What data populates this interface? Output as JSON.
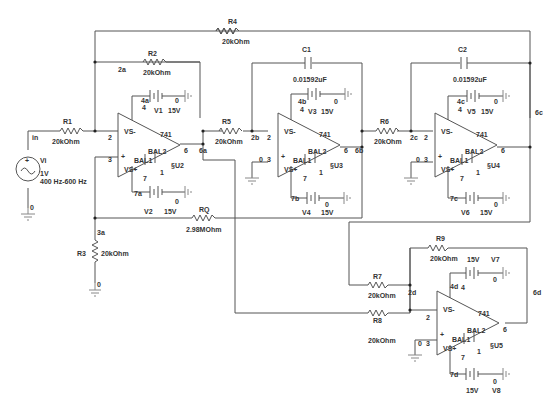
{
  "schematic": {
    "source": {
      "name": "Vi",
      "amplitude": "1V",
      "frequency": "400 Hz-600 Hz",
      "node_in": "in",
      "ground_node": "0"
    },
    "resistors": [
      {
        "id": "R1",
        "value": "20kOhm"
      },
      {
        "id": "R2",
        "value": "20kOhm"
      },
      {
        "id": "R3",
        "value": "20kOhm"
      },
      {
        "id": "R4",
        "value": "20kOhm"
      },
      {
        "id": "R5",
        "value": "20kOhm"
      },
      {
        "id": "R6",
        "value": "20kOhm"
      },
      {
        "id": "R7",
        "value": "20kOhm"
      },
      {
        "id": "R8",
        "value": "20kOhm"
      },
      {
        "id": "R9",
        "value": "20kOhm"
      },
      {
        "id": "RQ",
        "value": "2.98MOhm"
      }
    ],
    "capacitors": [
      {
        "id": "C1",
        "value": "0.01592uF"
      },
      {
        "id": "C2",
        "value": "0.01592uF"
      }
    ],
    "opamps": [
      {
        "id": "U2",
        "ref": "§U2",
        "model": "741",
        "vs_minus": "VS-",
        "vs_plus": "VS+",
        "bal1": "BAL1",
        "bal2": "BAL2",
        "pin2": "2",
        "pin3": "3",
        "pin4": "4",
        "pin6": "6",
        "pin7": "7",
        "pin1": "1",
        "pos_sign": "+"
      },
      {
        "id": "U3",
        "ref": "§U3",
        "model": "741",
        "vs_minus": "VS-",
        "vs_plus": "VS+",
        "bal1": "BAL1",
        "bal2": "BAL2",
        "pin2": "2",
        "pin3": "3",
        "pin4": "4",
        "pin6": "6",
        "pin7": "7",
        "pin1": "1",
        "pos_sign": "+",
        "gnd_label": "0"
      },
      {
        "id": "U4",
        "ref": "§U4",
        "model": "741",
        "vs_minus": "VS-",
        "vs_plus": "VS+",
        "bal1": "BAL1",
        "bal2": "BAL2",
        "pin2": "2",
        "pin3": "3",
        "pin4": "4",
        "pin6": "6",
        "pin7": "7",
        "pin1": "1",
        "pos_sign": "+",
        "gnd_label": "0"
      },
      {
        "id": "U5",
        "ref": "§U5",
        "model": "741",
        "vs_minus": "VS-",
        "vs_plus": "VS+",
        "bal1": "BAL1",
        "bal2": "BAL2",
        "pin2": "2",
        "pin3": "3",
        "pin4": "4",
        "pin6": "6",
        "pin7": "7",
        "pin1": "1",
        "pos_sign": "+",
        "gnd_label": "0"
      }
    ],
    "supplies": [
      {
        "id": "V1",
        "value": "15V",
        "node": "4a",
        "gnd": "0"
      },
      {
        "id": "V2",
        "value": "15V",
        "node": "7a",
        "gnd": "0"
      },
      {
        "id": "V3",
        "value": "15V",
        "node": "4b",
        "gnd": "0"
      },
      {
        "id": "V4",
        "value": "15V",
        "node": "7b",
        "gnd": "0"
      },
      {
        "id": "V5",
        "value": "15V",
        "node": "4c",
        "gnd": "0"
      },
      {
        "id": "V6",
        "value": "15V",
        "node": "7c",
        "gnd": "0"
      },
      {
        "id": "V7",
        "value": "15V",
        "node": "4d",
        "gnd": "0"
      },
      {
        "id": "V8",
        "value": "15V",
        "node": "7d",
        "gnd": "0"
      }
    ],
    "nodes": {
      "n2a": "2a",
      "n3a": "3a",
      "n6a": "6a",
      "n2b": "2b",
      "n6b": "6b",
      "n2c": "2c",
      "n6c": "6c",
      "n2d": "2d",
      "n6d": "6d",
      "r3_gnd": "0"
    }
  }
}
